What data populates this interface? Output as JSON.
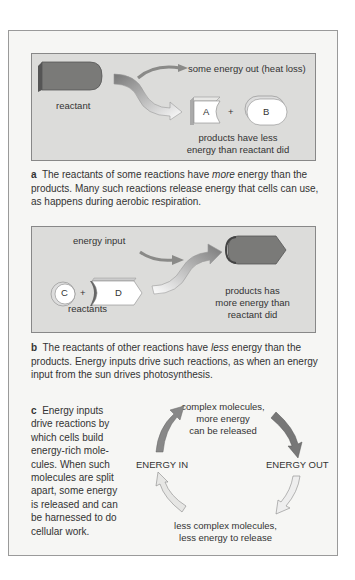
{
  "panel_a": {
    "reactant_label": "reactant",
    "energy_out_label": "some energy out (heat loss)",
    "product_a": "A",
    "plus": "+",
    "product_b": "B",
    "products_line1": "products have less",
    "products_line2": "energy than reactant did",
    "caption_letter": "a",
    "caption_pre": "The reactants of some reactions have ",
    "caption_em": "more",
    "caption_post": " energy than the products. Many such reactions release energy that cells can use, as happens during aerobic respiration."
  },
  "panel_b": {
    "energy_input_label": "energy input",
    "reactant_c": "C",
    "plus": "+",
    "reactant_d": "D",
    "reactants_label": "reactants",
    "products_line1": "products has",
    "products_line2": "more energy than",
    "products_line3": "reactant did",
    "caption_letter": "b",
    "caption_pre": "The reactants of other reactions have ",
    "caption_em": "less",
    "caption_post": " energy than the products. Energy inputs drive such reactions, as when an energy input from the sun drives photosynthesis."
  },
  "panel_c": {
    "caption_letter": "c",
    "caption_text": "Energy inputs drive reactions by which cells build energy-rich mole-cules. When such molecules are split apart, some energy is released and can be harnessed to do cellular work.",
    "top_line1": "complex molecules,",
    "top_line2": "more energy",
    "top_line3": "can be released",
    "left_label": "ENERGY IN",
    "right_label": "ENERGY OUT",
    "bottom_line1": "less complex molecules,",
    "bottom_line2": "less energy to release"
  },
  "colors": {
    "outer_bg": "#f6f6f4",
    "panel_bg": "#dcdcda",
    "dark_shape": "#6e6e6c",
    "light_shape": "#ffffff",
    "text": "#333333"
  }
}
